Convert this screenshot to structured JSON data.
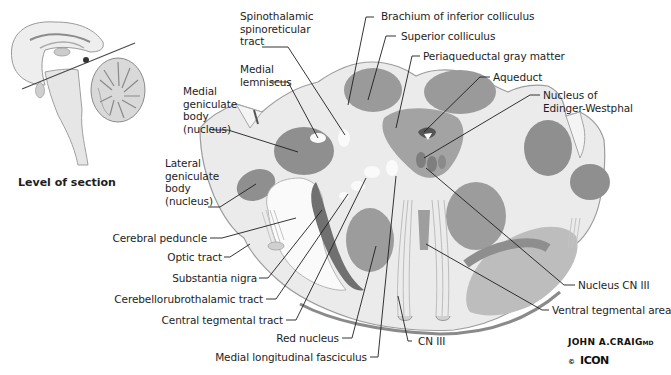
{
  "figure": {
    "inset_caption": "Level of section",
    "colors": {
      "background": "#ffffff",
      "nucleus_dark": "#8f8f8f",
      "nucleus_mid": "#a9a9a9",
      "tissue_light": "#d6d6d6",
      "tissue_pale": "#ececec",
      "white_matter": "#f8f8f8",
      "leader_line": "#1e1e1e",
      "text": "#1e1e1e"
    }
  },
  "labels": {
    "left": {
      "medial_geniculate": "Medial\ngeniculate\nbody\n(nucleus)",
      "lateral_geniculate": "Lateral\ngeniculate\nbody\n(nucleus)",
      "cerebral_peduncle": "Cerebral peduncle",
      "optic_tract": "Optic tract",
      "substantia_nigra": "Substantia nigra",
      "cerebellorubrothalamic": "Cerebellorubrothalamic tract",
      "central_tegmental": "Central tegmental tract",
      "red_nucleus": "Red nucleus",
      "mlf": "Medial longitudinal fasciculus"
    },
    "top": {
      "spinothalamic": "Spinothalamic\nspinoreticular\ntract",
      "medial_lemniscus": "Medial\nlemniscus",
      "brachium": "Brachium of inferior colliculus",
      "superior_colliculus": "Superior colliculus",
      "periaqueductal": "Periaqueductal gray matter",
      "aqueduct": "Aqueduct",
      "edinger_westphal": "Nucleus of\nEdinger-Westphal"
    },
    "right": {
      "nucleus_cn3": "Nucleus CN III",
      "ventral_tegmental": "Ventral tegmental area",
      "cn3": "CN III"
    }
  },
  "signature": {
    "artist": "JOHN A.CRAIG",
    "suffix": "MD",
    "copyright": "©",
    "publisher": "ICON"
  }
}
